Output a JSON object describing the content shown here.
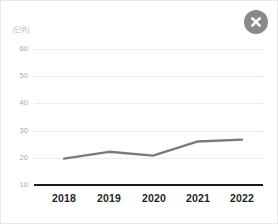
{
  "close_button": {
    "icon": "close-icon",
    "label": "닫기"
  },
  "chart_data": {
    "type": "line",
    "title": "",
    "subtitle": "",
    "unit_label": "(단위)",
    "xlabel": "",
    "ylabel": "",
    "categories": [
      "2018",
      "2019",
      "2020",
      "2021",
      "2022"
    ],
    "values": [
      19.7,
      22.2,
      20.8,
      26.0,
      26.7
    ],
    "series": [
      {
        "name": "series-1",
        "values": [
          19.7,
          22.2,
          20.8,
          26.0,
          26.7
        ]
      }
    ],
    "ylim": [
      10,
      60
    ],
    "yticks": [
      10,
      20,
      30,
      40,
      50,
      60
    ],
    "ytick_labels": [
      "10",
      "20",
      "30",
      "40",
      "50",
      "60"
    ],
    "grid": true,
    "legend": false,
    "legend_position": "none",
    "line_color": "#7a7a7a",
    "axis_color": "#1a1a1a",
    "grid_color": "#ededed",
    "tick_label_color": "#aaaaaa",
    "xtick_label_color": "#1f1f1f",
    "background_color": "#ffffff",
    "annotations": []
  }
}
